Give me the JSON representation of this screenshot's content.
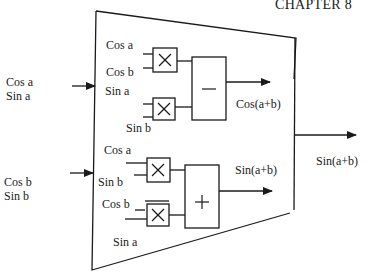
{
  "header": {
    "chapter": "CHAPTER 8"
  },
  "inputs": {
    "left_top": [
      "Cos a",
      "Sin a"
    ],
    "left_bottom": [
      "Cos b",
      "Sin b"
    ]
  },
  "block": {
    "cos_section": {
      "mult1_inputs": [
        "Cos a",
        "Cos b"
      ],
      "mult2_inputs": [
        "Sin a",
        "Sin b"
      ],
      "multiplier_symbol": "×",
      "combiner_symbol": "−",
      "output_label": "Cos(a+b)"
    },
    "sin_section": {
      "mult1_inputs": [
        "Cos a",
        "Sin b"
      ],
      "mult2_inputs": [
        "Cos b",
        "Sin a"
      ],
      "multiplier_symbol": "×",
      "combiner_symbol": "+",
      "output_label": "Sin(a+b)"
    }
  },
  "outputs": {
    "right": "Sin(a+b)"
  },
  "colors": {
    "stroke": "#1a1a1a",
    "background": "#ffffff"
  }
}
